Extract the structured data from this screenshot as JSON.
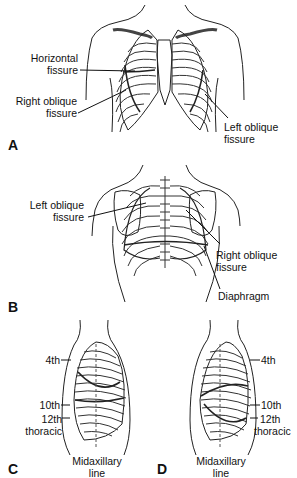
{
  "figure": {
    "panels": [
      {
        "id": "A",
        "view": "anterior",
        "labels": [
          "Horizontal fissure",
          "Right oblique fissure",
          "Left oblique fissure"
        ]
      },
      {
        "id": "B",
        "view": "posterior",
        "labels": [
          "Left oblique fissure",
          "Right oblique fissure",
          "Diaphragm"
        ]
      },
      {
        "id": "C",
        "view": "right lateral",
        "labels": [
          "4th",
          "10th",
          "12th thoracic",
          "Midaxillary line"
        ]
      },
      {
        "id": "D",
        "view": "left lateral",
        "labels": [
          "4th",
          "10th",
          "12th thoracic",
          "Midaxillary line"
        ]
      }
    ]
  },
  "panelA": {
    "letter": "A",
    "horizontal_fissure_1": "Horizontal",
    "horizontal_fissure_2": "fissure",
    "right_oblique_1": "Right oblique",
    "right_oblique_2": "fissure",
    "left_oblique_1": "Left oblique",
    "left_oblique_2": "fissure"
  },
  "panelB": {
    "letter": "B",
    "left_oblique_1": "Left oblique",
    "left_oblique_2": "fissure",
    "right_oblique_1": "Right oblique",
    "right_oblique_2": "fissure",
    "diaphragm": "Diaphragm"
  },
  "panelC": {
    "letter": "C",
    "rib4": "4th",
    "rib10": "10th",
    "rib12_1": "12th",
    "rib12_2": "thoracic",
    "midaxillary_1": "Midaxillary",
    "midaxillary_2": "line"
  },
  "panelD": {
    "letter": "D",
    "rib4": "4th",
    "rib10": "10th",
    "rib12_1": "12th",
    "rib12_2": "thoracic",
    "midaxillary_1": "Midaxillary",
    "midaxillary_2": "line"
  }
}
